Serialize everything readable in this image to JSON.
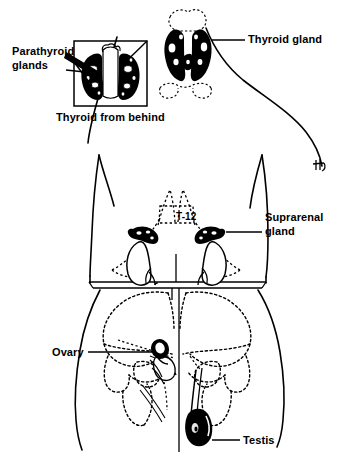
{
  "figure": {
    "background_color": "#ffffff",
    "ink_color": "#000000",
    "width": 349,
    "height": 467
  },
  "labels": {
    "parathyroid_glands": "Parathyroid\nglands",
    "parathyroid_line1": "Parathyroid",
    "parathyroid_line2": "glands",
    "thyroid_from_behind": "Thyroid from behind",
    "thyroid_gland": "Thyroid gland",
    "suprarenal_line1": "Suprarenal",
    "suprarenal_line2": "gland",
    "vertebra_marker": "T-12",
    "ovary": "Ovary",
    "testis": "Testis"
  },
  "structures": [
    {
      "name": "thyroid-gland",
      "label": "Thyroid gland",
      "fill": "solid-black",
      "region": "neck"
    },
    {
      "name": "parathyroid-glands",
      "label": "Parathyroid glands",
      "fill": "stippled",
      "region": "thyroid-posterior-inset"
    },
    {
      "name": "suprarenal-gland",
      "label": "Suprarenal gland",
      "fill": "solid-black",
      "region": "superior-to-kidney"
    },
    {
      "name": "kidney",
      "label": "",
      "fill": "outline",
      "region": "posterior-abdomen"
    },
    {
      "name": "ovary",
      "label": "Ovary",
      "fill": "solid-black",
      "region": "female-pelvis"
    },
    {
      "name": "testis",
      "label": "Testis",
      "fill": "solid-black",
      "region": "male-scrotum"
    },
    {
      "name": "vertebra-t12",
      "label": "T-12",
      "fill": "dotted-outline",
      "region": "thoracolumbar-spine"
    }
  ],
  "inset": {
    "caption": "Thyroid from behind",
    "border": "rectangle"
  },
  "artist_mark": "signature"
}
